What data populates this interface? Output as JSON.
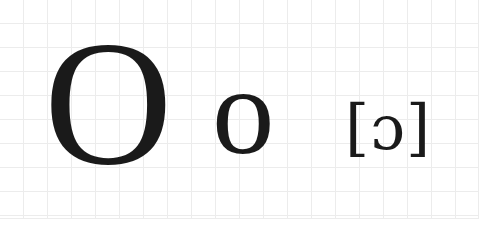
{
  "worksheet": {
    "title": "Letter O handwriting guide",
    "background_color": "#ffffff",
    "ink_color": "#1a1a1a",
    "grid_line_color": "#ececec",
    "grid_cell_size_px": 24
  },
  "glyphs": {
    "uppercase": {
      "character": "O",
      "label": "uppercase-letter-o",
      "case": "uppercase"
    },
    "lowercase": {
      "character": "o",
      "label": "lowercase-letter-o",
      "case": "lowercase"
    },
    "phonetic": {
      "character": "[ɔ]",
      "symbol": "ɔ",
      "opening_bracket": "[",
      "closing_bracket": "]",
      "label": "ipa-open-o-transcription",
      "notation": "IPA"
    }
  }
}
